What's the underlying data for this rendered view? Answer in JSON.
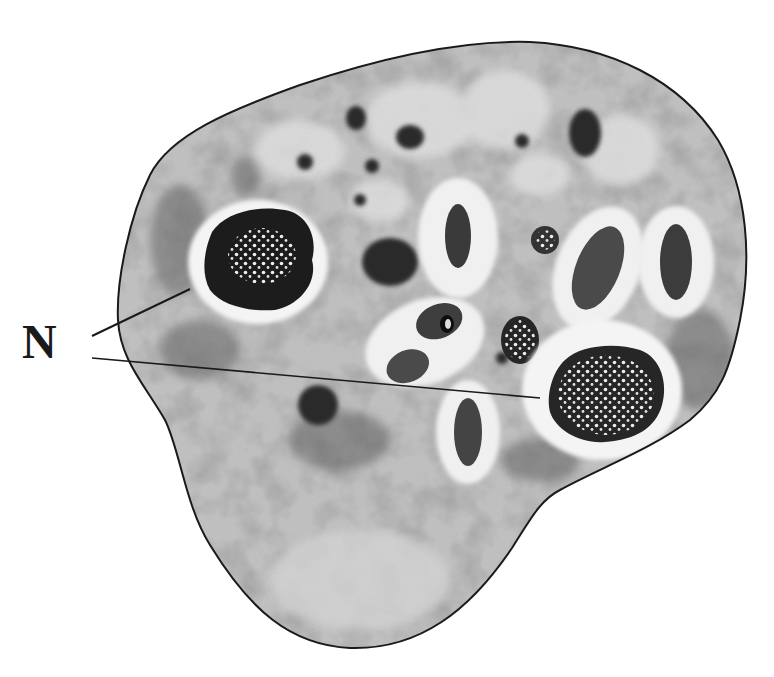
{
  "figure": {
    "type": "micrograph-illustration",
    "colors": {
      "background": "#ffffff",
      "cytoplasm": "#b8b8b8",
      "cytoplasm_dark": "#6e6e6e",
      "halo": "#f2f2f2",
      "nucleus": "#1e1e1e",
      "membrane": "#1a1a1a",
      "chromatin_dots": "#e8e8e8"
    }
  },
  "labels": {
    "nucleus_label": "N",
    "leader_lines": [
      {
        "from": [
          92,
          333
        ],
        "to": [
          188,
          292
        ],
        "target": "nucleus-left"
      },
      {
        "from": [
          92,
          355
        ],
        "to": [
          540,
          398
        ],
        "target": "nucleus-right"
      }
    ]
  },
  "structures": {
    "nuclei": [
      {
        "id": "nucleus-left",
        "cx": 258,
        "cy": 262,
        "halo_rx": 72,
        "halo_ry": 62
      },
      {
        "id": "nucleus-right",
        "cx": 602,
        "cy": 390,
        "halo_rx": 80,
        "halo_ry": 68
      }
    ],
    "vacuoles": [
      {
        "cx": 458,
        "cy": 238,
        "rx": 38,
        "ry": 58
      },
      {
        "cx": 596,
        "cy": 266,
        "rx": 44,
        "ry": 62,
        "rot": 20
      },
      {
        "cx": 676,
        "cy": 262,
        "rx": 38,
        "ry": 56
      },
      {
        "cx": 468,
        "cy": 430,
        "rx": 32,
        "ry": 52
      },
      {
        "cx": 412,
        "cy": 350,
        "rx": 50,
        "ry": 36,
        "rot": -20
      }
    ]
  }
}
